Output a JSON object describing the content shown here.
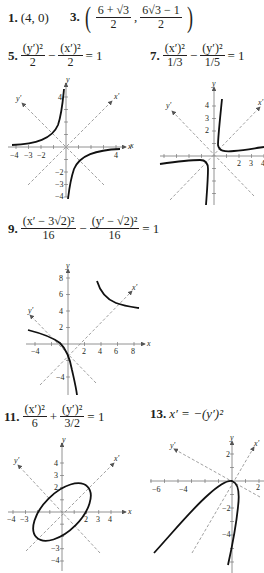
{
  "answers": {
    "a1": {
      "label": "1.",
      "value": "(4, 0)"
    },
    "a3": {
      "label": "3.",
      "open": "(",
      "close": ")",
      "comma": ",",
      "x_num": "6 + √3",
      "x_den": "2",
      "y_num": "6√3 − 1",
      "y_den": "2"
    },
    "a5": {
      "label": "5.",
      "t1_num": "(y′)²",
      "t1_den": "2",
      "op": "−",
      "t2_num": "(x′)²",
      "t2_den": "2",
      "rhs": "= 1"
    },
    "a7": {
      "label": "7.",
      "t1_num": "(x′)²",
      "t1_den": "1/3",
      "op": "−",
      "t2_num": "(y′)²",
      "t2_den": "1/5",
      "rhs": "= 1"
    },
    "a9": {
      "label": "9.",
      "t1_num": "(x′ − 3√2)²",
      "t1_den": "16",
      "op": "−",
      "t2_num": "(y′ − √2)²",
      "t2_den": "16",
      "rhs": "= 1"
    },
    "a11": {
      "label": "11.",
      "t1_num": "(x′)²",
      "t1_den": "6",
      "op": "+",
      "t2_num": "(y′)²",
      "t2_den": "3/2",
      "rhs": "= 1"
    },
    "a13": {
      "label": "13.",
      "eq": "x′ = −(y′)²"
    }
  },
  "graphs": {
    "g5": {
      "xaxis": "x",
      "yaxis": "y",
      "xprime": "x′",
      "yprime": "y′",
      "xticks": [
        "−4",
        "−3",
        "−2",
        "4"
      ],
      "yticks": [
        "4",
        "−2",
        "−3",
        "−4"
      ]
    },
    "g7": {
      "xaxis": "x",
      "yaxis": "y",
      "xprime": "x′",
      "yprime": "y′",
      "xticks": [
        "2",
        "3",
        "4"
      ],
      "yticks": [
        "4",
        "3",
        "2"
      ]
    },
    "g9": {
      "xaxis": "x",
      "yaxis": "y",
      "xprime": "x′",
      "yprime": "y′",
      "xticks": [
        "−4",
        "2",
        "4",
        "6",
        "8"
      ],
      "yticks": [
        "8",
        "6",
        "4",
        "2",
        "−4"
      ]
    },
    "g11": {
      "xaxis": "x",
      "yaxis": "y",
      "xprime": "x′",
      "yprime": "y′",
      "xticks": [
        "−4",
        "−3",
        "2",
        "3",
        "4"
      ],
      "yticks": [
        "4",
        "3",
        "2",
        "−3",
        "−4"
      ]
    },
    "g13": {
      "xaxis": "x",
      "yaxis": "y",
      "xprime": "x′",
      "yprime": "y′",
      "xticks": [
        "−6",
        "−4",
        "2"
      ],
      "yticks": [
        "2",
        "−2",
        "−4"
      ]
    }
  }
}
